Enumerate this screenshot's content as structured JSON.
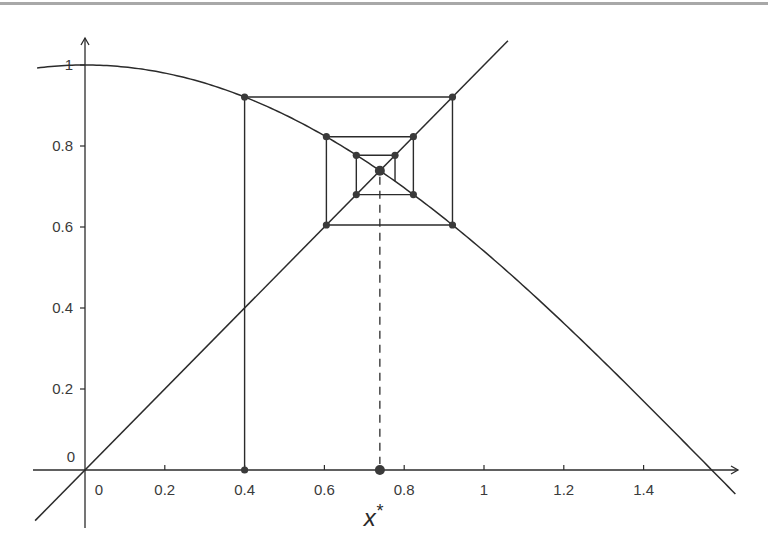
{
  "chart_data": {
    "type": "line",
    "title": "",
    "subtitle": "Cobweb diagram of fixed-point iteration x_{n+1} = cos(x_n)",
    "xlabel": "",
    "ylabel": "",
    "xlim": [
      -0.12,
      1.63
    ],
    "ylim": [
      -0.14,
      1.06
    ],
    "grid": false,
    "legend": null,
    "x_ticks": [
      0,
      0.2,
      0.4,
      0.6,
      0.8,
      1,
      1.2,
      1.4
    ],
    "x_tick_labels": [
      "0",
      "0.2",
      "0.4",
      "0.6",
      "0.8",
      "1",
      "1.2",
      "1.4"
    ],
    "y_ticks": [
      0,
      0.2,
      0.4,
      0.6,
      0.8,
      1
    ],
    "y_tick_labels": [
      "0",
      "0.2",
      "0.4",
      "0.6",
      "0.8",
      "1"
    ],
    "series": [
      {
        "name": "y = cos(x)",
        "function": "cos",
        "x_range": [
          -0.12,
          1.63
        ]
      },
      {
        "name": "y = x",
        "function": "identity",
        "x_range": [
          -0.125,
          1.06
        ]
      },
      {
        "name": "cobweb",
        "points": [
          [
            0.4,
            0
          ],
          [
            0.4,
            0.921
          ],
          [
            0.921,
            0.921
          ],
          [
            0.921,
            0.605
          ],
          [
            0.605,
            0.605
          ],
          [
            0.605,
            0.823
          ],
          [
            0.823,
            0.823
          ],
          [
            0.823,
            0.68
          ],
          [
            0.68,
            0.68
          ],
          [
            0.68,
            0.777
          ],
          [
            0.777,
            0.777
          ],
          [
            0.777,
            0.713
          ]
        ]
      }
    ],
    "fixed_point": {
      "x": 0.739,
      "y": 0.739
    },
    "annotations": [
      {
        "text": "x*",
        "x": 0.739,
        "y": 0,
        "note": "fixed point marked on x-axis with dashed vertical line"
      }
    ]
  },
  "labels": {
    "x_ticks": [
      "0",
      "0.2",
      "0.4",
      "0.6",
      "0.8",
      "1",
      "1.2",
      "1.4"
    ],
    "y_ticks": [
      "0",
      "0.2",
      "0.4",
      "0.6",
      "0.8",
      "1"
    ],
    "y_origin": "0",
    "fixed_point_label": "x",
    "fixed_point_sup": "*"
  },
  "colors": {
    "line": "#2b2b2b",
    "point": "#3a3a3a",
    "border": "#a8a8a8"
  }
}
